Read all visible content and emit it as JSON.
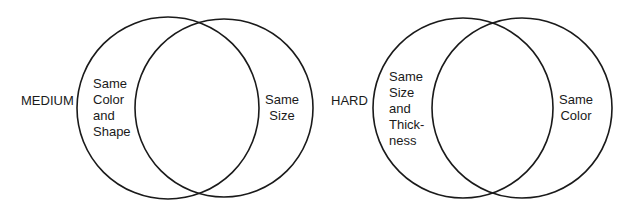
{
  "diagrams": [
    {
      "level": "MEDIUM",
      "left_region": "Same\nColor\nand\nShape",
      "right_region": "Same\nSize"
    },
    {
      "level": "HARD",
      "left_region": "Same\nSize\nand\nThick-\nness",
      "right_region": "Same\nColor"
    }
  ],
  "colors": {
    "stroke": "#1a1a1a",
    "background": "#ffffff"
  }
}
